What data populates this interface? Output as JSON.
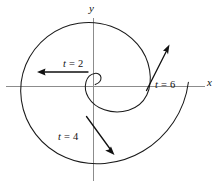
{
  "figure": {
    "background_color": "#ffffff",
    "curve_color": "#1a1a1a",
    "axis_color": "#8c8c8c",
    "text_color": "#111111"
  },
  "axes": {
    "x_label": "x",
    "y_label": "y",
    "origin_px": "93, 86",
    "x_axis_extent_px": "6 to 205",
    "y_axis_extent_px": "18 to 181"
  },
  "annotations": [
    {
      "id": "t2",
      "label": "t = 2",
      "var": "t",
      "rel": " = ",
      "value": "2"
    },
    {
      "id": "t4",
      "label": "t = 4",
      "var": "t",
      "rel": " = ",
      "value": "4"
    },
    {
      "id": "t6",
      "label": "t = 6",
      "var": "t",
      "rel": " = ",
      "value": "6"
    }
  ],
  "chart_data": {
    "type": "line",
    "title": "",
    "xlabel": "x",
    "ylabel": "y",
    "grid": false,
    "legend": null,
    "curve_description": "Outward-growing spiral drawn counterclockwise, starting at a tiny loop near the origin and expanding to a large arc that exits past the positive x-axis at lower right.",
    "series": [
      {
        "name": "spiral",
        "parameter": "t",
        "t_range": [
          0.8,
          7.2
        ],
        "points_px": [
          [
            95,
            84
          ],
          [
            99,
            81
          ],
          [
            101,
            78
          ],
          [
            100,
            75
          ],
          [
            96,
            74
          ],
          [
            91,
            76
          ],
          [
            87,
            81
          ],
          [
            86,
            88
          ],
          [
            88,
            96
          ],
          [
            94,
            104
          ],
          [
            104,
            110
          ],
          [
            116,
            112
          ],
          [
            129,
            110
          ],
          [
            140,
            102
          ],
          [
            147,
            91
          ],
          [
            150,
            77
          ],
          [
            148,
            62
          ],
          [
            140,
            48
          ],
          [
            128,
            36
          ],
          [
            113,
            27
          ],
          [
            96,
            22
          ],
          [
            78,
            22
          ],
          [
            60,
            27
          ],
          [
            44,
            37
          ],
          [
            31,
            52
          ],
          [
            23,
            69
          ],
          [
            20,
            88
          ],
          [
            23,
            107
          ],
          [
            31,
            125
          ],
          [
            45,
            141
          ],
          [
            63,
            153
          ],
          [
            84,
            161
          ],
          [
            107,
            163
          ],
          [
            130,
            160
          ],
          [
            151,
            151
          ],
          [
            169,
            137
          ],
          [
            183,
            119
          ],
          [
            192,
            100
          ],
          [
            196,
            86
          ]
        ]
      }
    ],
    "vectors": [
      {
        "name": "velocity-at-t2",
        "label": "t = 2",
        "tail_px": [
          88,
          72
        ],
        "tip_px": [
          38,
          72
        ],
        "direction": "left (negative x)",
        "label_pos_px": [
          63,
          59
        ]
      },
      {
        "name": "velocity-at-t4",
        "label": "t = 4",
        "tail_px": [
          87,
          117
        ],
        "tip_px": [
          114,
          155
        ],
        "direction": "down-right",
        "label_pos_px": [
          58,
          132
        ]
      },
      {
        "name": "velocity-at-t6",
        "label": "t = 6",
        "tail_px": [
          147,
          90
        ],
        "tip_px": [
          169,
          45
        ],
        "direction": "up-right",
        "label_pos_px": [
          155,
          80
        ]
      }
    ],
    "axis_lines": [
      {
        "name": "x-axis",
        "from_px": [
          6,
          86
        ],
        "to_px": [
          205,
          86
        ]
      },
      {
        "name": "y-axis",
        "from_px": [
          93,
          18
        ],
        "to_px": [
          93,
          181
        ]
      }
    ]
  }
}
